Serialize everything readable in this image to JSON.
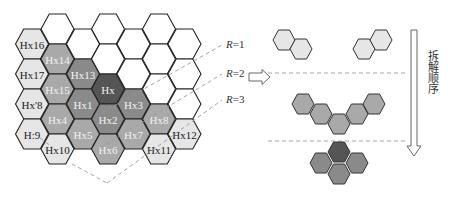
{
  "colors": {
    "white": "#ffffff",
    "light": "#e6e6e6",
    "medium": "#a9a9a9",
    "darkmed": "#8a8a8a",
    "dark": "#555555",
    "stroke": "#222222",
    "dash": "#9a9a9a",
    "label_dark": "#222222",
    "label_light": "#f2f2f2"
  },
  "grid": {
    "hex_half_width": 16.5,
    "hex_half_height": 15,
    "cells": [
      {
        "x": 57.5,
        "y": 29,
        "fill": "white",
        "label": ""
      },
      {
        "x": 108,
        "y": 29,
        "fill": "white",
        "label": ""
      },
      {
        "x": 159,
        "y": 29,
        "fill": "white",
        "label": ""
      },
      {
        "x": 32,
        "y": 44,
        "fill": "light",
        "label": "Hx16"
      },
      {
        "x": 83,
        "y": 44,
        "fill": "white",
        "label": ""
      },
      {
        "x": 133.5,
        "y": 44,
        "fill": "white",
        "label": ""
      },
      {
        "x": 184.5,
        "y": 44,
        "fill": "white",
        "label": ""
      },
      {
        "x": 57.5,
        "y": 59,
        "fill": "medium",
        "label": "Hx14"
      },
      {
        "x": 108,
        "y": 59,
        "fill": "white",
        "label": ""
      },
      {
        "x": 159,
        "y": 59,
        "fill": "white",
        "label": ""
      },
      {
        "x": 32,
        "y": 74,
        "fill": "light",
        "label": "Hx17"
      },
      {
        "x": 83,
        "y": 74,
        "fill": "darkmed",
        "label": "Hx13"
      },
      {
        "x": 133.5,
        "y": 74,
        "fill": "white",
        "label": ""
      },
      {
        "x": 184.5,
        "y": 74,
        "fill": "white",
        "label": ""
      },
      {
        "x": 57.5,
        "y": 89,
        "fill": "medium",
        "label": "Hx15"
      },
      {
        "x": 108,
        "y": 89,
        "fill": "dark",
        "label": "Hx"
      },
      {
        "x": 159,
        "y": 89,
        "fill": "white",
        "label": ""
      },
      {
        "x": 32,
        "y": 104,
        "fill": "light",
        "label": "Hx'8"
      },
      {
        "x": 83,
        "y": 104,
        "fill": "darkmed",
        "label": "Hx1"
      },
      {
        "x": 133.5,
        "y": 104,
        "fill": "darkmed",
        "label": "Hx3"
      },
      {
        "x": 184.5,
        "y": 104,
        "fill": "white",
        "label": ""
      },
      {
        "x": 57.5,
        "y": 119,
        "fill": "medium",
        "label": "Hx4"
      },
      {
        "x": 108,
        "y": 119,
        "fill": "darkmed",
        "label": "Hx2"
      },
      {
        "x": 159,
        "y": 119,
        "fill": "medium",
        "label": "Hx8"
      },
      {
        "x": 32,
        "y": 134,
        "fill": "light",
        "label": "H:9"
      },
      {
        "x": 83,
        "y": 134,
        "fill": "medium",
        "label": "Hx5"
      },
      {
        "x": 133.5,
        "y": 134,
        "fill": "medium",
        "label": "Hx7"
      },
      {
        "x": 184.5,
        "y": 134,
        "fill": "light",
        "label": "Hx12"
      },
      {
        "x": 57.5,
        "y": 149,
        "fill": "light",
        "label": "Hx10"
      },
      {
        "x": 108,
        "y": 149,
        "fill": "medium",
        "label": "Hx6"
      },
      {
        "x": 159,
        "y": 149,
        "fill": "light",
        "label": "Hx11"
      }
    ]
  },
  "radius_labels": [
    {
      "var": "R",
      "value": "=1",
      "x": 226,
      "y": 48,
      "line": [
        [
          96,
          116
        ],
        [
          222,
          45
        ]
      ]
    },
    {
      "var": "R",
      "value": "=2",
      "x": 226,
      "y": 77,
      "line": [
        [
          100,
          148
        ],
        [
          222,
          74
        ]
      ]
    },
    {
      "var": "R",
      "value": "=3",
      "x": 226,
      "y": 103,
      "line": [
        [
          107,
          183
        ],
        [
          222,
          100
        ]
      ]
    }
  ],
  "convergence_lines": [
    [
      [
        72,
        164
      ],
      [
        107,
        183
      ]
    ],
    [
      [
        40,
        138
      ],
      [
        52,
        147
      ]
    ]
  ],
  "arrow": {
    "direction": "right",
    "x": 252,
    "y": 77
  },
  "right_panel": {
    "separators": [
      {
        "y": 73
      },
      {
        "y": 141
      }
    ],
    "groups": [
      {
        "name": "ring-3",
        "cells": [
          {
            "x": 284,
            "y": 40,
            "fill": "light"
          },
          {
            "x": 301,
            "y": 49,
            "fill": "light"
          },
          {
            "x": 364,
            "y": 49,
            "fill": "light"
          },
          {
            "x": 381,
            "y": 40,
            "fill": "light"
          }
        ]
      },
      {
        "name": "ring-2",
        "cells": [
          {
            "x": 303,
            "y": 104,
            "fill": "medium"
          },
          {
            "x": 321,
            "y": 114,
            "fill": "medium"
          },
          {
            "x": 339,
            "y": 124,
            "fill": "medium"
          },
          {
            "x": 357,
            "y": 114,
            "fill": "medium"
          },
          {
            "x": 374,
            "y": 104,
            "fill": "medium"
          }
        ]
      },
      {
        "name": "ring-1",
        "cells": [
          {
            "x": 339,
            "y": 152,
            "fill": "dark"
          },
          {
            "x": 321,
            "y": 163,
            "fill": "darkmed"
          },
          {
            "x": 357,
            "y": 163,
            "fill": "darkmed"
          },
          {
            "x": 339,
            "y": 174,
            "fill": "darkmed"
          }
        ]
      }
    ],
    "small_hex_half_width": 11,
    "small_hex_half_height": 10,
    "order_label": "拆解顺序"
  }
}
